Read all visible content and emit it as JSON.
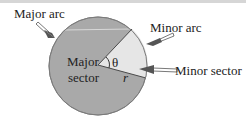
{
  "diagram": {
    "labels": {
      "major_arc": "Major arc",
      "minor_arc": "Minor arc",
      "minor_sector": "Minor sector",
      "major_sector_line1": "Major",
      "major_sector_line2": "sector",
      "theta": "θ",
      "radius": "r"
    },
    "colors": {
      "major_sector": "#a9a9a9",
      "minor_sector": "#e6e6e6",
      "outline": "#6f6f6f",
      "arrow_fill": "#555555"
    }
  }
}
